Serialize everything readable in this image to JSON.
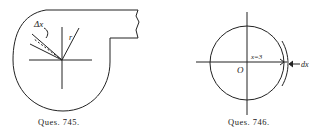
{
  "figures": [
    {
      "caption": "Ques. 745.",
      "labels": {
        "delta": "Δx",
        "radius": "r"
      }
    },
    {
      "caption": "Ques. 746.",
      "labels": {
        "origin": "O",
        "x_value": "x=3",
        "dx": "dx"
      }
    }
  ],
  "colors": {
    "ink": "#222222",
    "background": "#ffffff"
  }
}
